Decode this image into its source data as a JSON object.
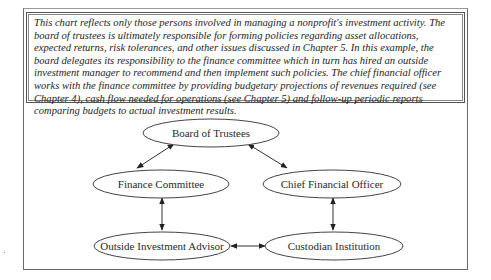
{
  "caption": {
    "text": "This chart reflects only those persons involved in managing a nonprofit's investment activity. The board of trustees is ultimately responsible for forming policies regarding asset allocations, expected returns, risk tolerances, and other issues discussed in Chapter 5. In this example, the board delegates its responsibility to the finance committee which in turn has hired an outside investment manager to recommend and then implement such policies. The chief financial officer works with the finance committee by providing budgetary projections of revenues required (see Chapter 4), cash flow needed for operations (see Chapter 5) and follow-up periodic reports comparing budgets to actual investment results."
  },
  "diagram": {
    "nodes": [
      {
        "id": "board",
        "label": "Board of Trustees"
      },
      {
        "id": "finance",
        "label": "Finance Committee"
      },
      {
        "id": "cfo",
        "label": "Chief Financial Officer"
      },
      {
        "id": "advisor",
        "label": "Outside Investment Advisor"
      },
      {
        "id": "custodian",
        "label": "Custodian Institution"
      }
    ],
    "edges": [
      {
        "from": "board",
        "to": "finance",
        "type": "bidirectional"
      },
      {
        "from": "board",
        "to": "cfo",
        "type": "bidirectional"
      },
      {
        "from": "finance",
        "to": "advisor",
        "type": "bidirectional"
      },
      {
        "from": "cfo",
        "to": "custodian",
        "type": "bidirectional"
      },
      {
        "from": "advisor",
        "to": "custodian",
        "type": "bidirectional"
      }
    ],
    "colors": {
      "stroke": "#333333",
      "background": "#ffffff"
    }
  }
}
